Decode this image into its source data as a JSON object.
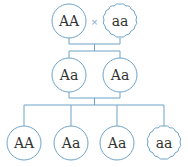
{
  "colors": {
    "line": "#6fa3c9",
    "text": "#333333",
    "background": "#ffffff"
  },
  "parents": {
    "left": {
      "genotype": "AA",
      "shape": "circle"
    },
    "cross_symbol": "×",
    "right": {
      "genotype": "aa",
      "shape": "cloud"
    }
  },
  "f1": [
    {
      "genotype": "Aa",
      "shape": "circle"
    },
    {
      "genotype": "Aa",
      "shape": "circle"
    }
  ],
  "f2": [
    {
      "genotype": "AA",
      "shape": "circle"
    },
    {
      "genotype": "Aa",
      "shape": "circle"
    },
    {
      "genotype": "Aa",
      "shape": "circle"
    },
    {
      "genotype": "aa",
      "shape": "cloud"
    }
  ]
}
